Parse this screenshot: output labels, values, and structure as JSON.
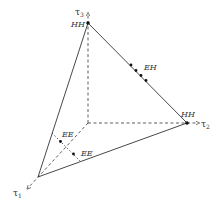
{
  "diagram": {
    "type": "simplex-3d",
    "colors": {
      "stroke": "#333333",
      "background": "#ffffff"
    },
    "axes": [
      {
        "id": "tau1",
        "symbol": "τ",
        "index": "1"
      },
      {
        "id": "tau2",
        "symbol": "τ",
        "index": "2"
      },
      {
        "id": "tau3",
        "symbol": "τ",
        "index": "3"
      }
    ],
    "vertex_labels": {
      "top": "HH",
      "right": "HH"
    },
    "point_labels": {
      "eh": "EH",
      "ee_upper": "EE",
      "ee_lower": "EE"
    }
  }
}
